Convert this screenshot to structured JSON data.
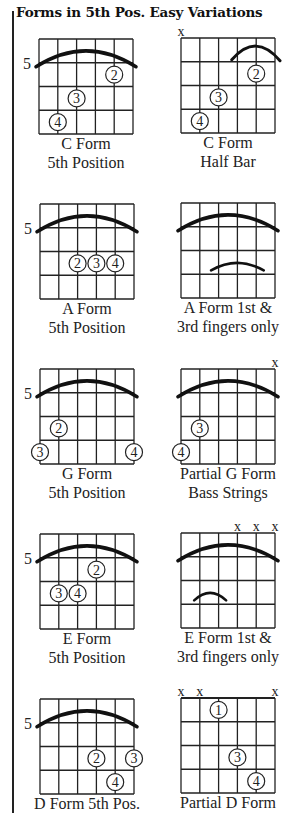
{
  "title": "Forms in 5th Pos. Easy Variations",
  "fret_label": "5",
  "diagrams": [
    {
      "id": "c-form",
      "label1": "C Form",
      "label2": "5th Position",
      "x": 39,
      "y": 39,
      "fret_label": true,
      "barre": "full",
      "dots": [
        {
          "s": 4,
          "f": 2,
          "n": "2"
        },
        {
          "s": 2,
          "f": 3,
          "n": "3"
        },
        {
          "s": 1,
          "f": 4,
          "n": "4"
        }
      ],
      "muted": []
    },
    {
      "id": "c-form-half-bar",
      "label1": "C Form",
      "label2": "Half Bar",
      "x": 181,
      "y": 38,
      "fret_label": false,
      "barre": "half",
      "dots": [
        {
          "s": 4,
          "f": 2,
          "n": "2"
        },
        {
          "s": 2,
          "f": 3,
          "n": "3"
        },
        {
          "s": 1,
          "f": 4,
          "n": "4"
        }
      ],
      "muted": [
        0
      ]
    },
    {
      "id": "a-form",
      "label1": "A Form",
      "label2": "5th Position",
      "x": 40,
      "y": 204,
      "fret_label": true,
      "barre": "full",
      "dots": [
        {
          "s": 2,
          "f": 3,
          "n": "2"
        },
        {
          "s": 3,
          "f": 3,
          "n": "3"
        },
        {
          "s": 4,
          "f": 3,
          "n": "4"
        }
      ],
      "muted": []
    },
    {
      "id": "a-form-1st-3rd",
      "label1": "A Form 1st &",
      "label2": "3rd fingers only",
      "x": 181,
      "y": 203,
      "fret_label": false,
      "barre": "full",
      "small_barre": {
        "from": 1.6,
        "to": 4.4,
        "f": 3
      },
      "dots": [],
      "muted": []
    },
    {
      "id": "g-form",
      "label1": "G Form",
      "label2": "5th Position",
      "x": 40,
      "y": 369,
      "fret_label": true,
      "barre": "full",
      "dots": [
        {
          "s": 1,
          "f": 3,
          "n": "2"
        },
        {
          "s": 0,
          "f": 4,
          "n": "3"
        },
        {
          "s": 5,
          "f": 4,
          "n": "4"
        }
      ],
      "muted": []
    },
    {
      "id": "partial-g-form",
      "label1": "Partial G Form",
      "label2": "Bass Strings",
      "x": 181,
      "y": 369,
      "fret_label": false,
      "barre": "full",
      "dots": [
        {
          "s": 1,
          "f": 3,
          "n": "3"
        },
        {
          "s": 0,
          "f": 4,
          "n": "4"
        }
      ],
      "muted": [
        5
      ]
    },
    {
      "id": "e-form",
      "label1": "E Form",
      "label2": "5th Position",
      "x": 40,
      "y": 534,
      "fret_label": true,
      "barre": "full",
      "dots": [
        {
          "s": 3,
          "f": 2,
          "n": "2"
        },
        {
          "s": 1,
          "f": 3,
          "n": "3"
        },
        {
          "s": 2,
          "f": 3,
          "n": "4"
        }
      ],
      "muted": []
    },
    {
      "id": "e-form-1st-3rd",
      "label1": "E Form 1st &",
      "label2": "3rd fingers only",
      "x": 181,
      "y": 533,
      "fret_label": false,
      "barre": "full",
      "small_barre": {
        "from": 0.7,
        "to": 2.4,
        "f": 3
      },
      "dots": [],
      "muted": [
        3,
        4,
        5
      ]
    },
    {
      "id": "d-form",
      "label1": "D Form 5th  Pos.",
      "label2": "",
      "x": 40,
      "y": 699,
      "fret_label": true,
      "barre": "full",
      "dots": [
        {
          "s": 3,
          "f": 3,
          "n": "2"
        },
        {
          "s": 5,
          "f": 3,
          "n": "3"
        },
        {
          "s": 4,
          "f": 4,
          "n": "4"
        }
      ],
      "muted": []
    },
    {
      "id": "partial-d-form",
      "label1": "Partial D Form",
      "label2": "",
      "x": 181,
      "y": 698,
      "fret_label": false,
      "barre": "none",
      "nut": true,
      "dots": [
        {
          "s": 2,
          "f": 1,
          "n": "1"
        },
        {
          "s": 3,
          "f": 3,
          "n": "3"
        },
        {
          "s": 4,
          "f": 4,
          "n": "4"
        }
      ],
      "muted": [
        0,
        1,
        5
      ]
    }
  ],
  "muted_symbol": "x"
}
